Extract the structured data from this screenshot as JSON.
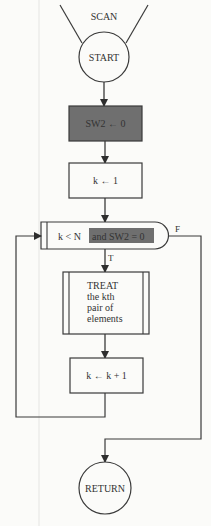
{
  "diagram": {
    "title": "SCAN",
    "colors": {
      "line": "#3a3a3a",
      "highlight_fill": "#6f6f6f",
      "background": "#fbfbf9"
    },
    "nodes": {
      "start": {
        "type": "terminal",
        "label": "START"
      },
      "init_sw2": {
        "type": "process",
        "label": "SW2 ← 0",
        "highlighted": true
      },
      "init_k": {
        "type": "process",
        "label": "k ← 1"
      },
      "loop_test": {
        "type": "decision",
        "label_plain": "k < N",
        "label_highlighted": "and SW2 = 0",
        "true_label": "T",
        "false_label": "F"
      },
      "treat": {
        "type": "subroutine",
        "lines": [
          "TREAT",
          "the kth",
          "pair of",
          "elements"
        ]
      },
      "increment": {
        "type": "process",
        "label": "k ← k + 1"
      },
      "return": {
        "type": "terminal",
        "label": "RETURN"
      }
    },
    "edges": [
      {
        "from": "start",
        "to": "init_sw2"
      },
      {
        "from": "init_sw2",
        "to": "init_k"
      },
      {
        "from": "init_k",
        "to": "loop_test"
      },
      {
        "from": "loop_test",
        "to": "treat",
        "label": "T"
      },
      {
        "from": "treat",
        "to": "increment"
      },
      {
        "from": "increment",
        "to": "loop_test"
      },
      {
        "from": "loop_test",
        "to": "return",
        "label": "F"
      }
    ]
  }
}
